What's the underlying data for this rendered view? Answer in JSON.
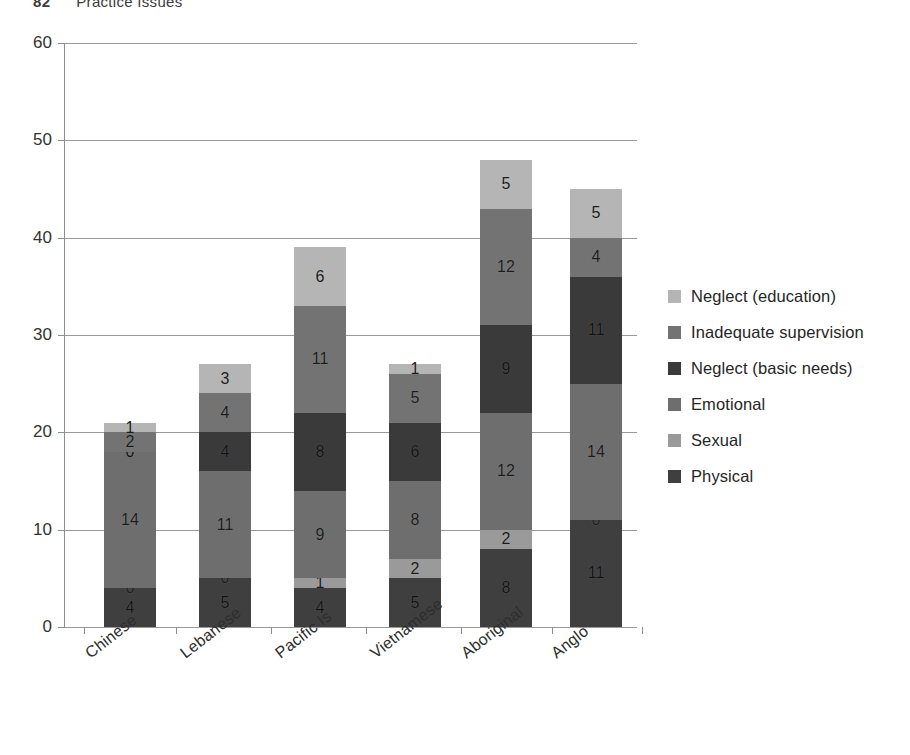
{
  "running_head": {
    "folio": "82",
    "title": "Practice Issues"
  },
  "chart_data": {
    "type": "bar",
    "subtype": "stacked-bar",
    "title": "",
    "xlabel": "",
    "ylabel": "",
    "ylim": [
      0,
      60
    ],
    "yticks": [
      0,
      10,
      20,
      30,
      40,
      50,
      60
    ],
    "grid": true,
    "legend_position": "right",
    "categories": [
      "Chinese",
      "Lebanese",
      "Pacific Is",
      "Vietnamese",
      "Aboriginal",
      "Anglo"
    ],
    "series": [
      {
        "name": "Physical",
        "color": "#3f3f3f",
        "values": [
          4,
          5,
          4,
          5,
          8,
          11
        ]
      },
      {
        "name": "Sexual",
        "color": "#9a9a9a",
        "values": [
          0,
          0,
          1,
          2,
          2,
          0
        ]
      },
      {
        "name": "Emotional",
        "color": "#6e6e6e",
        "values": [
          14,
          11,
          9,
          8,
          12,
          14
        ]
      },
      {
        "name": "Neglect (basic needs)",
        "color": "#3a3a3a",
        "values": [
          0,
          4,
          8,
          6,
          9,
          11
        ]
      },
      {
        "name": "Inadequate supervision",
        "color": "#737373",
        "values": [
          2,
          4,
          11,
          5,
          12,
          4
        ]
      },
      {
        "name": "Neglect (education)",
        "color": "#b5b5b5",
        "values": [
          1,
          3,
          6,
          1,
          5,
          5
        ]
      }
    ],
    "totals": [
      21,
      27,
      39,
      27,
      48,
      45
    ],
    "legend": [
      {
        "label": "Neglect (education)",
        "color": "#b5b5b5"
      },
      {
        "label": "Inadequate supervision",
        "color": "#737373"
      },
      {
        "label": "Neglect (basic needs)",
        "color": "#3a3a3a"
      },
      {
        "label": "Emotional",
        "color": "#6e6e6e"
      },
      {
        "label": "Sexual",
        "color": "#9a9a9a"
      },
      {
        "label": "Physical",
        "color": "#3f3f3f"
      }
    ]
  }
}
